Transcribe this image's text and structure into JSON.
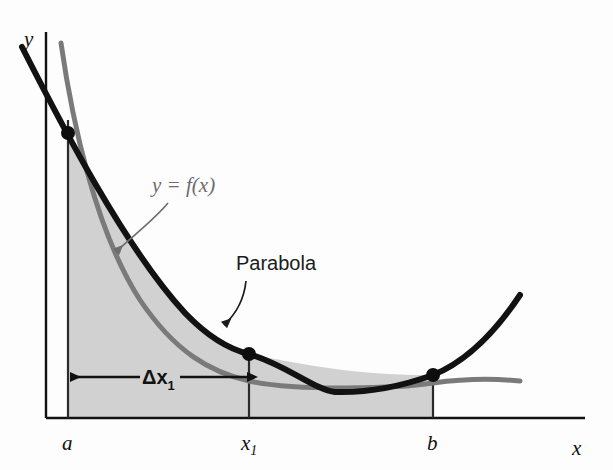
{
  "figure": {
    "background_color": "#fdfdfd"
  },
  "axes": {
    "y_axis_label": "y",
    "x_axis_label": "x",
    "axis_color": "#111111",
    "x_axis_y_px": 418,
    "y_axis_x_px": 46,
    "x_axis_end_px": 585,
    "y_axis_top_px": 32
  },
  "tick_labels": [
    {
      "name": "a",
      "text": "a",
      "subscript": "",
      "x_px": 68,
      "label_x_px": 62,
      "label_y_px": 448
    },
    {
      "name": "x1",
      "text": "x",
      "subscript": "1",
      "x_px": 249,
      "label_x_px": 243,
      "label_y_px": 448
    },
    {
      "name": "b",
      "text": "b",
      "subscript": "",
      "x_px": 433,
      "label_x_px": 427,
      "label_y_px": 448
    }
  ],
  "curves": {
    "function_curve": {
      "name": "f(x)",
      "label": "y  =  f(x)",
      "label_parts": {
        "y": "y",
        "equals": "=",
        "fx": "f(x)"
      },
      "color": "#7a7a7a",
      "stroke_width": 5,
      "start_px": [
        61,
        43
      ],
      "end_px": [
        520,
        381
      ],
      "description": "Decreasing, convex gray curve that flattens out toward the right."
    },
    "parabola": {
      "name": "parabola",
      "label": "Parabola",
      "color": "#121212",
      "stroke_width": 6,
      "start_px": [
        22,
        47
      ],
      "end_px": [
        520,
        295
      ],
      "vertex_px": [
        335,
        392
      ],
      "description": "Black parabola through the three marked points, with minimum between x1 and b."
    }
  },
  "intersection_points": [
    {
      "name": "point-at-a",
      "x_px": 68,
      "y_px": 133,
      "radius": 7
    },
    {
      "name": "point-at-x1",
      "x_px": 249,
      "y_px": 354,
      "radius": 7
    },
    {
      "name": "point-at-b",
      "x_px": 433,
      "y_px": 375,
      "radius": 7
    }
  ],
  "shaded_region": {
    "name": "area-under-curve",
    "fill_color": "#c9c9c9",
    "opacity": 0.85,
    "from_label": "a",
    "to_label": "b",
    "description": "Region between x = a and x = b bounded above by the upper of the two curves and below by the x-axis."
  },
  "delta_dimension": {
    "label_main": "Δx",
    "label_subscript": "1",
    "full_label": "Δx1",
    "from_x_px": 68,
    "to_x_px": 249,
    "y_px": 377,
    "color": "#111111",
    "arrow_style": "double-headed"
  },
  "annotations": {
    "function_label": {
      "text": "y  =  f(x)",
      "x_px": 152,
      "y_px": 190,
      "color": "#6d6d6d",
      "leader_from_px": [
        168,
        203
      ],
      "leader_to_px": [
        112,
        255
      ]
    },
    "parabola_label": {
      "text": "Parabola",
      "x_px": 236,
      "y_px": 270,
      "color": "#1b1b1b",
      "leader_from_px": [
        246,
        281
      ],
      "leader_to_px": [
        221,
        328
      ]
    }
  },
  "vertical_lines": [
    {
      "name": "vline-at-a",
      "x_px": 68,
      "top_y_px": 120,
      "bottom_y_px": 418
    },
    {
      "name": "vline-at-x1",
      "x_px": 249,
      "top_y_px": 354,
      "bottom_y_px": 418
    },
    {
      "name": "vline-at-b",
      "x_px": 433,
      "top_y_px": 375,
      "bottom_y_px": 418
    }
  ],
  "colors": {
    "black": "#121212",
    "gray_curve": "#7a7a7a",
    "shade": "#c9c9c9",
    "axis": "#111111"
  }
}
